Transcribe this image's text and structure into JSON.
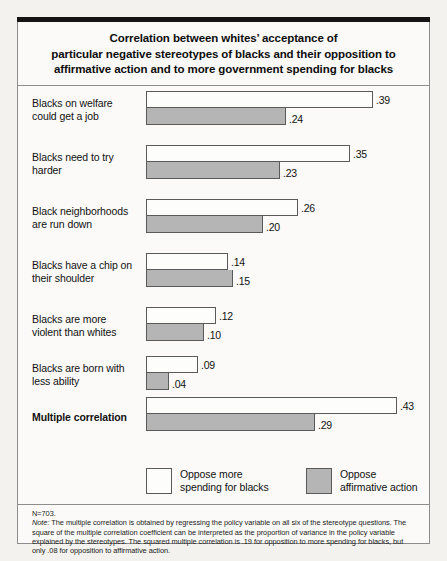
{
  "title": {
    "line1": "Correlation between whites’ acceptance of",
    "line2": "particular negative stereotypes of blacks and their opposition to",
    "line3": "affirmative action and to more government spending for blacks"
  },
  "legend": {
    "series1_label_line1": "Oppose more",
    "series1_label_line2": "spending for blacks",
    "series2_label_line1": "Oppose",
    "series2_label_line2": "affirmative action"
  },
  "note": {
    "n": "N=703.",
    "label": "Note:",
    "text": " The multiple correlation is obtained by regressing the policy variable on all six of the stereotype questions. The square of the multiple correlation coefficient can be interpreted as the proportion of variance in the policy variable explained by the stereotypes. The squared multiple correlation is .19 for opposition to more spending for blacks, but only .08 for opposition to affirmative action."
  },
  "rows": [
    {
      "label_line1": "Blacks on welfare",
      "label_line2": "could get a job",
      "v1": ".39",
      "v2": ".24",
      "bold": false
    },
    {
      "label_line1": "Blacks need to try",
      "label_line2": "harder",
      "v1": ".35",
      "v2": ".23",
      "bold": false
    },
    {
      "label_line1": "Black neighborhoods",
      "label_line2": "are run down",
      "v1": ".26",
      "v2": ".20",
      "bold": false
    },
    {
      "label_line1": "Blacks have a chip on",
      "label_line2": "their shoulder",
      "v1": ".14",
      "v2": ".15",
      "bold": false
    },
    {
      "label_line1": "Blacks are more",
      "label_line2": "violent than whites",
      "v1": ".12",
      "v2": ".10",
      "bold": false
    },
    {
      "label_line1": "Blacks are born with",
      "label_line2": "less ability",
      "v1": ".09",
      "v2": ".04",
      "bold": false
    },
    {
      "label_line1": "Multiple correlation",
      "label_line2": "",
      "v1": ".43",
      "v2": ".29",
      "bold": true
    }
  ],
  "chart_data": {
    "type": "bar",
    "orientation": "horizontal",
    "title": "Correlation between whites’ acceptance of particular negative stereotypes of blacks and their opposition to affirmative action and to more government spending for blacks",
    "xlabel": "",
    "ylabel": "",
    "xlim": [
      0,
      0.43
    ],
    "grid": false,
    "legend_position": "bottom",
    "categories": [
      "Blacks on welfare could get a job",
      "Blacks need to try harder",
      "Black neighborhoods are run down",
      "Blacks have a chip on their shoulder",
      "Blacks are more violent than whites",
      "Blacks are born with less ability",
      "Multiple correlation"
    ],
    "series": [
      {
        "name": "Oppose more spending for blacks",
        "color": "#fdfdfb",
        "values": [
          0.39,
          0.35,
          0.26,
          0.14,
          0.12,
          0.09,
          0.43
        ]
      },
      {
        "name": "Oppose affirmative action",
        "color": "#b5b5b5",
        "values": [
          0.24,
          0.23,
          0.2,
          0.15,
          0.1,
          0.04,
          0.29
        ]
      }
    ],
    "annotations": [
      "N=703.",
      "Note: The multiple correlation is obtained by regressing the policy variable on all six of the stereotype questions. The square of the multiple correlation coefficient can be interpreted as the proportion of variance in the policy variable explained by the stereotypes. The squared multiple correlation is .19 for opposition to more spending for blacks, but only .08 for opposition to affirmative action."
    ]
  }
}
